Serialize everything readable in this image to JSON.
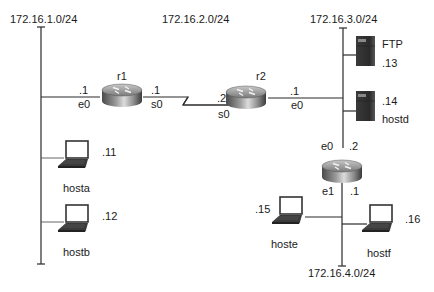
{
  "networks": {
    "net1": "172.16.1.0/24",
    "net2": "172.16.2.0/24",
    "net3": "172.16.3.0/24",
    "net4": "172.16.4.0/24"
  },
  "routers": {
    "r1": {
      "name": "r1",
      "e0_addr": ".1",
      "e0_label": "e0",
      "s0_addr": ".1",
      "s0_label": "s0"
    },
    "r2": {
      "name": "r2",
      "s0_addr": ".2",
      "s0_label": "s0",
      "e0_addr": ".1",
      "e0_label": "e0"
    },
    "r3": {
      "e0_label": "e0",
      "e0_addr": ".2",
      "e1_label": "e1",
      "e1_addr": ".1"
    }
  },
  "hosts": {
    "hosta": {
      "name": "hosta",
      "addr": ".11",
      "type": "laptop-icon"
    },
    "hostb": {
      "name": "hostb",
      "addr": ".12",
      "type": "laptop-icon"
    },
    "ftp": {
      "name": "FTP",
      "addr": ".13",
      "type": "server-icon"
    },
    "hostd": {
      "name": "hostd",
      "addr": ".14",
      "type": "server-icon"
    },
    "hoste": {
      "name": "hoste",
      "addr": ".15",
      "type": "laptop-icon"
    },
    "hostf": {
      "name": "hostf",
      "addr": ".16",
      "type": "laptop-icon"
    }
  }
}
